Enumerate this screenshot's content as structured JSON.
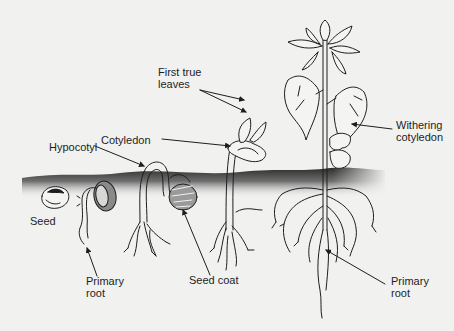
{
  "diagram": {
    "labels": {
      "first_true_leaves": "First true\nleaves",
      "cotyledon": "Cotyledon",
      "hypocotyl": "Hypocotyl",
      "withering_cotyledon": "Withering\ncotyledon",
      "seed": "Seed",
      "primary_root_left": "Primary\nroot",
      "seed_coat": "Seed coat",
      "primary_root_right": "Primary\nroot"
    },
    "stages": [
      {
        "name": "seed"
      },
      {
        "name": "radicle-emergence"
      },
      {
        "name": "hypocotyl-arch"
      },
      {
        "name": "cotyledon-emergence"
      },
      {
        "name": "mature-seedling"
      }
    ],
    "colors": {
      "background": "#f1f1ef",
      "ink": "#1e1e1e",
      "soil_top": "#2a2a2a",
      "soil_fade": "#f1f1ef"
    }
  }
}
